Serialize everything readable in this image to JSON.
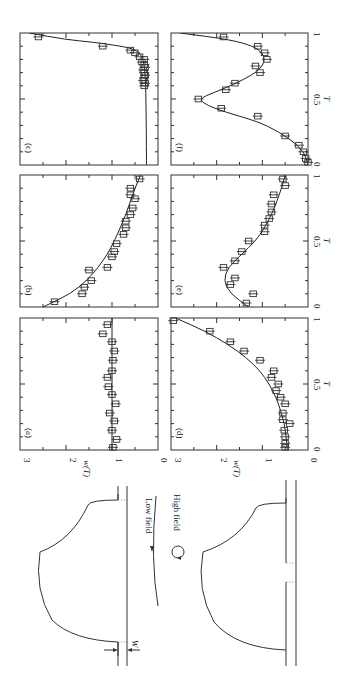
{
  "figure": {
    "orientation": "rotated-90-ccw",
    "panel_labels": [
      "(a)",
      "(b)",
      "(c)",
      "(d)",
      "(e)",
      "(f)"
    ],
    "x_axis_label": "T",
    "y_axis_label": "w(T)",
    "x_ticks": [
      "0",
      "0.5",
      "1"
    ],
    "y_ticks": [
      "0",
      "1",
      "2",
      "3"
    ],
    "diagram": {
      "low_field_label": "Low field",
      "high_field_label": "High field",
      "width_label": "W"
    }
  },
  "chart_data": [
    {
      "panel": "(a)",
      "type": "scatter",
      "xlabel": "T",
      "ylabel": "w(T)",
      "xlim": [
        0,
        1
      ],
      "ylim": [
        0,
        3
      ],
      "points": {
        "x": [
          0.02,
          0.08,
          0.15,
          0.22,
          0.28,
          0.35,
          0.42,
          0.48,
          0.55,
          0.6,
          0.68,
          0.75,
          0.82,
          0.88,
          0.95
        ],
        "y": [
          0.98,
          0.9,
          1.0,
          0.95,
          1.05,
          0.92,
          1.0,
          1.08,
          1.1,
          1.0,
          0.98,
          0.95,
          1.0,
          1.2,
          1.1
        ]
      },
      "curve": {
        "x": [
          0,
          1
        ],
        "y": [
          1.0,
          1.0
        ]
      }
    },
    {
      "panel": "(b)",
      "type": "scatter",
      "xlabel": "",
      "ylabel": "",
      "xlim": [
        0,
        1
      ],
      "ylim": [
        0,
        3
      ],
      "points": {
        "x": [
          0.04,
          0.1,
          0.15,
          0.2,
          0.28,
          0.3,
          0.38,
          0.42,
          0.48,
          0.55,
          0.6,
          0.65,
          0.7,
          0.75,
          0.82,
          0.85,
          0.9,
          0.97
        ],
        "y": [
          2.25,
          1.65,
          1.6,
          1.45,
          1.5,
          1.1,
          1.0,
          0.95,
          0.9,
          0.75,
          0.7,
          0.7,
          0.6,
          0.55,
          0.5,
          0.6,
          0.6,
          0.4
        ]
      },
      "curve": {
        "x": [
          0,
          0.1,
          0.2,
          0.3,
          0.4,
          0.5,
          0.6,
          0.7,
          0.8,
          0.9,
          1.0
        ],
        "y": [
          2.5,
          1.9,
          1.55,
          1.3,
          1.1,
          0.95,
          0.82,
          0.7,
          0.6,
          0.5,
          0.38
        ]
      }
    },
    {
      "panel": "(c)",
      "type": "scatter",
      "xlabel": "",
      "ylabel": "",
      "xlim": [
        0,
        1
      ],
      "ylim": [
        0,
        3
      ],
      "points": {
        "x": [
          0.6,
          0.62,
          0.64,
          0.66,
          0.68,
          0.7,
          0.72,
          0.74,
          0.76,
          0.78,
          0.8,
          0.82,
          0.85,
          0.87,
          0.9,
          0.97
        ],
        "y": [
          0.3,
          0.28,
          0.32,
          0.3,
          0.28,
          0.3,
          0.32,
          0.28,
          0.3,
          0.35,
          0.3,
          0.4,
          0.5,
          0.6,
          1.2,
          2.6
        ]
      },
      "curve": {
        "x": [
          0,
          0.5,
          0.7,
          0.8,
          0.85,
          0.88,
          0.9,
          0.93,
          0.95,
          1.0
        ],
        "y": [
          0.25,
          0.26,
          0.28,
          0.32,
          0.4,
          0.55,
          0.8,
          1.4,
          2.0,
          2.8
        ]
      }
    },
    {
      "panel": "(d)",
      "type": "scatter",
      "xlabel": "T",
      "ylabel": "w(T)",
      "xlim": [
        0,
        1
      ],
      "ylim": [
        0,
        3
      ],
      "points": {
        "x": [
          0.02,
          0.05,
          0.1,
          0.15,
          0.2,
          0.23,
          0.28,
          0.35,
          0.4,
          0.45,
          0.5,
          0.55,
          0.6,
          0.68,
          0.75,
          0.82,
          0.9,
          0.98
        ],
        "y": [
          0.5,
          0.5,
          0.5,
          0.52,
          0.4,
          0.55,
          0.55,
          0.5,
          0.6,
          0.7,
          0.65,
          0.8,
          0.75,
          1.05,
          1.4,
          1.7,
          2.15,
          2.95
        ]
      },
      "curve": {
        "x": [
          0,
          0.1,
          0.2,
          0.3,
          0.4,
          0.5,
          0.6,
          0.7,
          0.8,
          0.9,
          1.0
        ],
        "y": [
          0.45,
          0.48,
          0.52,
          0.6,
          0.7,
          0.85,
          1.05,
          1.35,
          1.75,
          2.25,
          2.9
        ]
      }
    },
    {
      "panel": "(e)",
      "type": "scatter",
      "xlabel": "T",
      "ylabel": "",
      "xlim": [
        0,
        1
      ],
      "ylim": [
        0,
        3
      ],
      "points": {
        "x": [
          0.03,
          0.1,
          0.17,
          0.22,
          0.3,
          0.35,
          0.42,
          0.5,
          0.57,
          0.62,
          0.67,
          0.72,
          0.78,
          0.85,
          0.92,
          0.97
        ],
        "y": [
          1.35,
          1.2,
          1.7,
          1.6,
          1.85,
          1.6,
          1.45,
          1.3,
          0.95,
          0.95,
          0.85,
          0.8,
          0.8,
          0.75,
          0.5,
          0.55
        ]
      },
      "curve": {
        "x": [
          0,
          0.1,
          0.2,
          0.3,
          0.4,
          0.5,
          0.6,
          0.7,
          0.8,
          0.9,
          1.0
        ],
        "y": [
          1.3,
          1.7,
          1.85,
          1.75,
          1.45,
          1.15,
          0.95,
          0.8,
          0.68,
          0.58,
          0.5
        ]
      }
    },
    {
      "panel": "(f)",
      "type": "scatter",
      "xlabel": "T",
      "ylabel": "",
      "xlim": [
        0,
        1
      ],
      "ylim": [
        0,
        3
      ],
      "points": {
        "x": [
          0.02,
          0.05,
          0.1,
          0.15,
          0.22,
          0.37,
          0.43,
          0.5,
          0.57,
          0.62,
          0.7,
          0.75,
          0.8,
          0.85,
          0.9,
          0.97
        ],
        "y": [
          0.0,
          0.05,
          0.1,
          0.2,
          0.5,
          1.1,
          1.9,
          2.4,
          1.8,
          1.6,
          1.05,
          1.15,
          0.9,
          0.95,
          1.1,
          1.85
        ]
      },
      "curve": {
        "x": [
          0,
          0.1,
          0.2,
          0.3,
          0.35,
          0.4,
          0.45,
          0.5,
          0.55,
          0.6,
          0.65,
          0.7,
          0.75,
          0.8,
          0.85,
          0.9,
          0.95,
          1.0
        ],
        "y": [
          0.0,
          0.08,
          0.4,
          0.9,
          1.3,
          1.8,
          2.2,
          2.4,
          2.05,
          1.7,
          1.4,
          1.15,
          1.0,
          0.95,
          1.0,
          1.2,
          1.7,
          2.8
        ]
      }
    }
  ]
}
